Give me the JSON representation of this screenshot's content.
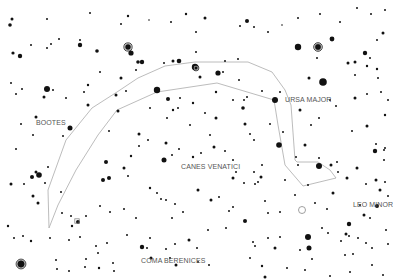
{
  "chart": {
    "background": "#ffffff",
    "star_color": "#111111",
    "line_color": "#b4b4b4",
    "label_color": "#555555"
  },
  "labels": [
    {
      "id": "bootes",
      "text": "BOOTES",
      "x": 36,
      "y": 125
    },
    {
      "id": "ursa-major",
      "text": "URSA MAJOR",
      "x": 285,
      "y": 102
    },
    {
      "id": "canes-venatici",
      "text": "CANES VENATICI",
      "x": 181,
      "y": 169
    },
    {
      "id": "leo-minor",
      "text": "LEO MINOR",
      "x": 353,
      "y": 207
    },
    {
      "id": "coma-berenices",
      "text": "COMA BERENICES",
      "x": 141,
      "y": 263
    }
  ],
  "constellation_lines": [
    {
      "id": "arc-outer",
      "points": [
        [
          49,
          228
        ],
        [
          48,
          190
        ],
        [
          66,
          140
        ],
        [
          92,
          108
        ],
        [
          117,
          92
        ],
        [
          138,
          78
        ],
        [
          165,
          66
        ],
        [
          195,
          62
        ],
        [
          248,
          62
        ],
        [
          272,
          72
        ],
        [
          285,
          90
        ],
        [
          291,
          105
        ],
        [
          295,
          160
        ]
      ]
    },
    {
      "id": "arc-inner",
      "points": [
        [
          49,
          228
        ],
        [
          58,
          205
        ],
        [
          76,
          170
        ],
        [
          98,
          135
        ],
        [
          117,
          110
        ],
        [
          157,
          92
        ],
        [
          217,
          83
        ],
        [
          274,
          100
        ],
        [
          278,
          125
        ],
        [
          285,
          165
        ],
        [
          303,
          186
        ]
      ]
    },
    {
      "id": "dipper-bowl",
      "points": [
        [
          295,
          160
        ],
        [
          297,
          162
        ],
        [
          318,
          162
        ],
        [
          330,
          170
        ],
        [
          336,
          178
        ],
        [
          303,
          186
        ]
      ]
    }
  ],
  "stars": [
    [
      12,
      19,
      1.5
    ],
    [
      10,
      25,
      1.8
    ],
    [
      47,
      19,
      1
    ],
    [
      90,
      13,
      1
    ],
    [
      128,
      16,
      1.2
    ],
    [
      149,
      20,
      0.8
    ],
    [
      171,
      22,
      1
    ],
    [
      186,
      14,
      1.2
    ],
    [
      196,
      32,
      1
    ],
    [
      205,
      18,
      1.5
    ],
    [
      247,
      21,
      2
    ],
    [
      240,
      26,
      1
    ],
    [
      254,
      27,
      1
    ],
    [
      282,
      25,
      0.8
    ],
    [
      298,
      18,
      1
    ],
    [
      320,
      14,
      1
    ],
    [
      340,
      22,
      1
    ],
    [
      357,
      8,
      1
    ],
    [
      371,
      14,
      1
    ],
    [
      385,
      10,
      1
    ],
    [
      13,
      53,
      1.6
    ],
    [
      20,
      56,
      2.2
    ],
    [
      31,
      45,
      1
    ],
    [
      47,
      48,
      1
    ],
    [
      51,
      44,
      1
    ],
    [
      59,
      39,
      1
    ],
    [
      80,
      45,
      2.2
    ],
    [
      80,
      40,
      1
    ],
    [
      97,
      51,
      1.8
    ],
    [
      121,
      24,
      1
    ],
    [
      131,
      53,
      2.6
    ],
    [
      138,
      62,
      1.8
    ],
    [
      142,
      62,
      2.2
    ],
    [
      164,
      63,
      1
    ],
    [
      173,
      61,
      1.5
    ],
    [
      179,
      61,
      2.3
    ],
    [
      195,
      67,
      3.2
    ],
    [
      196,
      52,
      1
    ],
    [
      218,
      73,
      2.6
    ],
    [
      225,
      61,
      1
    ],
    [
      238,
      59,
      1
    ],
    [
      268,
      32,
      1
    ],
    [
      298,
      47,
      3.2
    ],
    [
      332,
      39,
      2.4
    ],
    [
      317,
      58,
      1
    ],
    [
      348,
      63,
      1.5
    ],
    [
      355,
      62,
      1.5
    ],
    [
      365,
      53,
      2.2
    ],
    [
      370,
      58,
      1
    ],
    [
      377,
      40,
      1
    ],
    [
      355,
      75,
      1
    ],
    [
      323,
      82,
      3.8
    ],
    [
      309,
      78,
      1.5
    ],
    [
      367,
      66,
      1.2
    ],
    [
      377,
      69,
      1.2
    ],
    [
      378,
      78,
      1
    ],
    [
      383,
      33,
      1.5
    ],
    [
      11,
      83,
      1
    ],
    [
      16,
      94,
      1
    ],
    [
      22,
      89,
      1
    ],
    [
      47,
      89,
      3
    ],
    [
      44,
      97,
      1.5
    ],
    [
      53,
      90,
      1
    ],
    [
      66,
      98,
      1
    ],
    [
      88,
      85,
      1.2
    ],
    [
      84,
      92,
      1
    ],
    [
      88,
      105,
      1.5
    ],
    [
      100,
      72,
      1
    ],
    [
      116,
      95,
      1.5
    ],
    [
      121,
      78,
      1.5
    ],
    [
      118,
      111,
      1.5
    ],
    [
      126,
      91,
      1
    ],
    [
      136,
      70,
      1
    ],
    [
      157,
      90,
      3.2
    ],
    [
      168,
      99,
      2
    ],
    [
      173,
      110,
      1.2
    ],
    [
      180,
      98,
      1
    ],
    [
      193,
      103,
      1.2
    ],
    [
      200,
      77,
      1.5
    ],
    [
      216,
      92,
      1.2
    ],
    [
      223,
      72,
      1
    ],
    [
      239,
      80,
      1
    ],
    [
      244,
      100,
      1
    ],
    [
      262,
      91,
      1
    ],
    [
      275,
      100,
      3
    ],
    [
      243,
      108,
      1.8
    ],
    [
      247,
      97,
      1
    ],
    [
      280,
      92,
      1
    ],
    [
      300,
      110,
      1.5
    ],
    [
      330,
      100,
      1
    ],
    [
      355,
      98,
      1.5
    ],
    [
      367,
      94,
      1
    ],
    [
      381,
      92,
      1
    ],
    [
      388,
      100,
      1
    ],
    [
      36,
      117,
      1.5
    ],
    [
      70,
      128,
      2.5
    ],
    [
      21,
      124,
      1
    ],
    [
      33,
      135,
      1
    ],
    [
      63,
      136,
      1
    ],
    [
      109,
      131,
      1
    ],
    [
      139,
      134,
      1.5
    ],
    [
      150,
      108,
      1
    ],
    [
      167,
      118,
      1
    ],
    [
      178,
      108,
      1
    ],
    [
      190,
      125,
      1
    ],
    [
      205,
      113,
      1
    ],
    [
      216,
      118,
      1.5
    ],
    [
      233,
      100,
      1
    ],
    [
      245,
      124,
      1.5
    ],
    [
      250,
      134,
      1
    ],
    [
      254,
      140,
      1
    ],
    [
      270,
      124,
      1
    ],
    [
      279,
      145,
      2.8
    ],
    [
      283,
      132,
      1
    ],
    [
      311,
      125,
      1
    ],
    [
      319,
      118,
      1
    ],
    [
      336,
      106,
      1
    ],
    [
      352,
      131,
      1
    ],
    [
      367,
      126,
      1.5
    ],
    [
      376,
      144,
      1
    ],
    [
      384,
      150,
      1
    ],
    [
      385,
      115,
      1.2
    ],
    [
      16,
      149,
      1
    ],
    [
      36,
      172,
      1.5
    ],
    [
      32,
      177,
      2
    ],
    [
      39,
      175,
      2.8
    ],
    [
      11,
      184,
      1.5
    ],
    [
      48,
      167,
      1
    ],
    [
      106,
      162,
      2
    ],
    [
      103,
      180,
      2
    ],
    [
      109,
      178,
      2
    ],
    [
      124,
      168,
      1.5
    ],
    [
      128,
      176,
      1
    ],
    [
      131,
      156,
      1.2
    ],
    [
      139,
      146,
      1
    ],
    [
      148,
      140,
      1
    ],
    [
      164,
      160,
      2.5
    ],
    [
      166,
      143,
      1.5
    ],
    [
      172,
      155,
      1
    ],
    [
      179,
      149,
      1
    ],
    [
      193,
      157,
      1.2
    ],
    [
      201,
      153,
      1
    ],
    [
      210,
      135,
      1
    ],
    [
      214,
      147,
      1.5
    ],
    [
      225,
      151,
      1
    ],
    [
      233,
      160,
      1
    ],
    [
      233,
      178,
      1.5
    ],
    [
      236,
      172,
      1
    ],
    [
      244,
      183,
      1
    ],
    [
      254,
      172,
      1
    ],
    [
      261,
      177,
      1.5
    ],
    [
      262,
      165,
      1
    ],
    [
      258,
      182,
      1
    ],
    [
      296,
      157,
      1
    ],
    [
      298,
      165,
      1
    ],
    [
      305,
      145,
      1.5
    ],
    [
      319,
      166,
      3
    ],
    [
      319,
      158,
      1
    ],
    [
      331,
      165,
      1.5
    ],
    [
      337,
      162,
      1
    ],
    [
      338,
      172,
      1
    ],
    [
      347,
      178,
      1.5
    ],
    [
      357,
      168,
      1.5
    ],
    [
      375,
      151,
      2.2
    ],
    [
      385,
      148,
      1
    ],
    [
      366,
      184,
      1
    ],
    [
      384,
      160,
      1
    ],
    [
      376,
      180,
      1.5
    ],
    [
      360,
      205,
      1
    ],
    [
      380,
      190,
      1.5
    ],
    [
      24,
      184,
      1
    ],
    [
      33,
      196,
      1.5
    ],
    [
      38,
      203,
      1.5
    ],
    [
      45,
      183,
      1
    ],
    [
      61,
      192,
      1
    ],
    [
      62,
      213,
      1
    ],
    [
      78,
      222,
      2
    ],
    [
      86,
      216,
      1
    ],
    [
      71,
      216,
      1
    ],
    [
      100,
      206,
      1
    ],
    [
      110,
      212,
      1
    ],
    [
      124,
      209,
      1
    ],
    [
      136,
      218,
      1
    ],
    [
      150,
      188,
      1.2
    ],
    [
      157,
      193,
      1
    ],
    [
      161,
      199,
      1
    ],
    [
      166,
      200,
      1
    ],
    [
      175,
      204,
      1
    ],
    [
      172,
      218,
      1
    ],
    [
      183,
      212,
      1
    ],
    [
      198,
      190,
      1.5
    ],
    [
      211,
      200,
      1.5
    ],
    [
      219,
      197,
      1
    ],
    [
      233,
      207,
      1
    ],
    [
      229,
      211,
      1
    ],
    [
      245,
      221,
      2
    ],
    [
      255,
      184,
      1
    ],
    [
      265,
      201,
      1
    ],
    [
      268,
      213,
      1
    ],
    [
      280,
      212,
      1
    ],
    [
      285,
      180,
      1
    ],
    [
      295,
      195,
      1
    ],
    [
      308,
      185,
      1
    ],
    [
      315,
      203,
      1
    ],
    [
      327,
      209,
      1
    ],
    [
      333,
      193,
      1.5
    ],
    [
      349,
      224,
      2.2
    ],
    [
      346,
      234,
      1.5
    ],
    [
      349,
      236,
      1
    ],
    [
      364,
      215,
      1.5
    ],
    [
      377,
      206,
      2
    ],
    [
      370,
      218,
      1
    ],
    [
      385,
      182,
      1
    ],
    [
      388,
      196,
      1
    ],
    [
      8,
      226,
      1.2
    ],
    [
      14,
      238,
      1
    ],
    [
      23,
      236,
      1
    ],
    [
      31,
      241,
      1.2
    ],
    [
      50,
      238,
      1
    ],
    [
      69,
      240,
      1
    ],
    [
      72,
      226,
      1.2
    ],
    [
      80,
      237,
      1
    ],
    [
      86,
      259,
      1
    ],
    [
      96,
      246,
      1
    ],
    [
      98,
      253,
      1
    ],
    [
      107,
      243,
      1
    ],
    [
      127,
      235,
      1
    ],
    [
      142,
      247,
      2.2
    ],
    [
      147,
      248,
      1
    ],
    [
      150,
      238,
      1
    ],
    [
      151,
      258,
      1.5
    ],
    [
      166,
      249,
      1
    ],
    [
      175,
      244,
      1
    ],
    [
      189,
      240,
      1.5
    ],
    [
      197,
      248,
      1
    ],
    [
      208,
      230,
      1
    ],
    [
      226,
      228,
      1
    ],
    [
      253,
      242,
      1
    ],
    [
      255,
      246,
      1
    ],
    [
      275,
      248,
      1.5
    ],
    [
      268,
      238,
      1
    ],
    [
      280,
      237,
      1
    ],
    [
      300,
      250,
      1
    ],
    [
      308,
      237,
      3
    ],
    [
      309,
      248,
      2.5
    ],
    [
      312,
      259,
      1
    ],
    [
      322,
      228,
      1
    ],
    [
      328,
      233,
      1
    ],
    [
      341,
      241,
      1
    ],
    [
      345,
      255,
      1
    ],
    [
      353,
      254,
      1
    ],
    [
      358,
      238,
      1
    ],
    [
      366,
      243,
      1
    ],
    [
      372,
      248,
      1
    ],
    [
      386,
      230,
      1
    ],
    [
      388,
      244,
      1
    ],
    [
      21,
      264,
      3.8
    ],
    [
      56,
      260,
      1
    ],
    [
      57,
      269,
      1
    ],
    [
      69,
      271,
      1
    ],
    [
      85,
      267,
      1
    ],
    [
      99,
      268,
      1.2
    ],
    [
      113,
      263,
      1
    ],
    [
      114,
      271,
      1
    ],
    [
      170,
      258,
      1
    ],
    [
      176,
      265,
      1.5
    ],
    [
      198,
      262,
      1
    ],
    [
      209,
      265,
      1
    ],
    [
      250,
      258,
      1
    ],
    [
      262,
      266,
      1.2
    ],
    [
      265,
      277,
      1.5
    ],
    [
      287,
      268,
      1
    ],
    [
      305,
      270,
      1
    ],
    [
      330,
      276,
      1
    ],
    [
      350,
      272,
      1
    ],
    [
      372,
      265,
      1
    ],
    [
      383,
      275,
      1
    ]
  ],
  "ringed_stars": [
    {
      "x": 128,
      "y": 47,
      "r": 3.2
    },
    {
      "x": 196,
      "y": 68,
      "r": 2
    },
    {
      "x": 318,
      "y": 47,
      "r": 3.4
    },
    {
      "x": 21,
      "y": 264,
      "r": 4
    }
  ],
  "open_markers": [
    {
      "x": 302,
      "y": 210,
      "r": 3.5,
      "shape": "circle"
    },
    {
      "x": 77,
      "y": 221,
      "r": 2.2,
      "shape": "square"
    }
  ]
}
